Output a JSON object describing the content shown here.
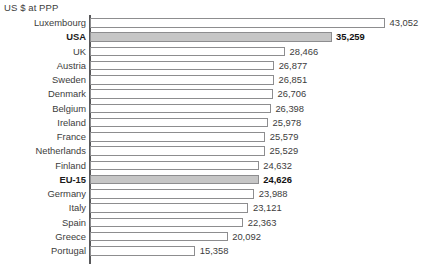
{
  "chart_data": {
    "type": "bar",
    "orientation": "horizontal",
    "title": "US $ at PPP",
    "xlabel": "",
    "ylabel": "",
    "xlim": [
      0,
      43052
    ],
    "grid": false,
    "legend": null,
    "value_labels": true,
    "highlight_color": "#c6c6c6",
    "bar_fill_color": "#ffffff",
    "bar_border_color": "#8d8d8f",
    "axis_color": "#58585a",
    "categories": [
      "Luxembourg",
      "USA",
      "UK",
      "Austria",
      "Sweden",
      "Denmark",
      "Belgium",
      "Ireland",
      "France",
      "Netherlands",
      "Finland",
      "EU-15",
      "Germany",
      "Italy",
      "Spain",
      "Greece",
      "Portugal"
    ],
    "values": [
      43052,
      35259,
      28466,
      26877,
      26851,
      26706,
      26398,
      25978,
      25579,
      25529,
      24632,
      24626,
      23988,
      23121,
      22363,
      20092,
      15358
    ],
    "value_labels_text": [
      "43,052",
      "35,259",
      "28,466",
      "26,877",
      "26,851",
      "26,706",
      "26,398",
      "25,978",
      "25,579",
      "25,529",
      "24,632",
      "24,626",
      "23,988",
      "23,121",
      "22,363",
      "20,092",
      "15,358"
    ],
    "highlighted": [
      false,
      true,
      false,
      false,
      false,
      false,
      false,
      false,
      false,
      false,
      false,
      true,
      false,
      false,
      false,
      false,
      false
    ]
  }
}
